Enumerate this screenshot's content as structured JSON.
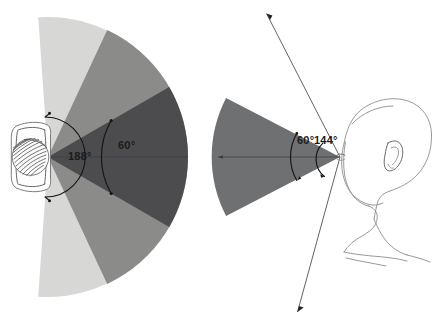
{
  "figure": {
    "background_color": "#ffffff"
  },
  "panels": [
    {
      "id": "left-panel",
      "subject": "bird-eye",
      "subject_icon": "eye-icon",
      "description": "Lateral eye with wide panoramic visual field",
      "vertex": {
        "x": 48,
        "y": 157
      },
      "radius": 140,
      "total_field": {
        "label": "188°",
        "value": 188,
        "arc_radius": 40
      },
      "binocular_field": {
        "label": "60°",
        "value": 60,
        "arc_radius": 73
      },
      "sectors": [
        {
          "name": "outer-peripheral-field",
          "value": 188,
          "half_angle": 94,
          "color": "#d7d8d6"
        },
        {
          "name": "mid-peripheral-field",
          "value": 130,
          "half_angle": 65,
          "color": "#8b8c8a"
        },
        {
          "name": "central-binocular-field",
          "value": 60,
          "half_angle": 30,
          "color": "#4c4c4e"
        }
      ],
      "labels": [
        {
          "name": "angle-label-188",
          "text": "188°",
          "x": 68,
          "y": 156
        },
        {
          "name": "angle-label-60-left",
          "text": "60°",
          "x": 118,
          "y": 146
        }
      ]
    },
    {
      "id": "right-panel",
      "subject": "human-head",
      "subject_icon": "head-profile-icon",
      "description": "Human head profile with frontal binocular cone and peripheral limits",
      "vertex": {
        "x": 340,
        "y": 157
      },
      "radius": 118,
      "binocular_field": {
        "label": "60°",
        "value": 60,
        "arc_radius": 47,
        "color": "#6f7072"
      },
      "peripheral_field": {
        "label": "144°",
        "value": 144,
        "arc_radius": 22,
        "ray_length": 168
      },
      "labels": [
        {
          "name": "angle-label-60-right",
          "text": "60°",
          "x": 298,
          "y": 141
        },
        {
          "name": "angle-label-144",
          "text": "144°",
          "x": 313,
          "y": 141
        }
      ]
    }
  ],
  "colors": {
    "sector_light": "#d7d8d6",
    "sector_mid": "#8b8c8a",
    "sector_dark": "#4c4c4e",
    "cone_right": "#6f7072",
    "line_sketch": "#8d8d92",
    "line_arc": "#15151a",
    "text": "#1b1b1b"
  }
}
